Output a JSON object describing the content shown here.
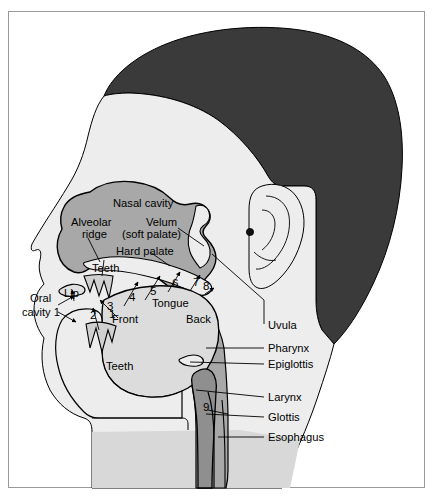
{
  "figure": {
    "frame_border_color": "#9a9a9a",
    "background_color": "#ffffff"
  },
  "colors": {
    "hair": "#3a3a3a",
    "skin": "#e3e3e3",
    "face_light": "#ededed",
    "cavity_mid": "#a8a8a8",
    "cavity_dark": "#8f8f8f",
    "tongue": "#dcdcdc",
    "outline": "#000000",
    "neck": "#d8d8d8"
  },
  "labels": {
    "nasal_cavity": "Nasal cavity",
    "alveolar_ridge_line1": "Alveolar",
    "alveolar_ridge_line2": "ridge",
    "velum_line1": "Velum",
    "velum_line2": "(soft palate)",
    "hard_palate": "Hard palate",
    "teeth_upper": "Teeth",
    "teeth_lower": "Teeth",
    "lip": "Lip",
    "oral_cavity_line1": "Oral",
    "oral_cavity_line2": "cavity 1",
    "front": "Front",
    "back": "Back",
    "tongue": "Tongue",
    "uvula": "Uvula",
    "pharynx": "Pharynx",
    "epiglottis": "Epiglottis",
    "larynx": "Larynx",
    "glottis": "Glottis",
    "esophagus": "Esophagus"
  },
  "numbered_points": [
    {
      "id": "1",
      "label": "1",
      "meaning": "oral cavity / lips",
      "x": 109,
      "y": 315
    },
    {
      "id": "2",
      "label": "2",
      "meaning": "dental / teeth",
      "x": 90,
      "y": 316
    },
    {
      "id": "3",
      "label": "3",
      "meaning": "alveolar",
      "x": 107,
      "y": 307
    },
    {
      "id": "4",
      "label": "4",
      "meaning": "post-alveolar",
      "x": 129,
      "y": 298
    },
    {
      "id": "5",
      "label": "5",
      "meaning": "palatal",
      "x": 150,
      "y": 292
    },
    {
      "id": "6",
      "label": "6",
      "meaning": "velar",
      "x": 172,
      "y": 284
    },
    {
      "id": "7",
      "label": "7",
      "meaning": "uvular",
      "x": 193,
      "y": 283
    },
    {
      "id": "8",
      "label": "8",
      "meaning": "pharyngeal",
      "x": 203,
      "y": 287
    },
    {
      "id": "9",
      "label": "9",
      "meaning": "glottal",
      "x": 203,
      "y": 408
    }
  ],
  "leader_labels": [
    {
      "name": "uvula",
      "text": "Uvula",
      "x": 268,
      "y": 329
    },
    {
      "name": "pharynx",
      "text": "Pharynx",
      "x": 268,
      "y": 352
    },
    {
      "name": "epiglottis",
      "text": "Epiglottis",
      "x": 268,
      "y": 368
    },
    {
      "name": "larynx",
      "text": "Larynx",
      "x": 268,
      "y": 401
    },
    {
      "name": "glottis",
      "text": "Glottis",
      "x": 268,
      "y": 421
    },
    {
      "name": "esophagus",
      "text": "Esophagus",
      "x": 268,
      "y": 441
    }
  ]
}
